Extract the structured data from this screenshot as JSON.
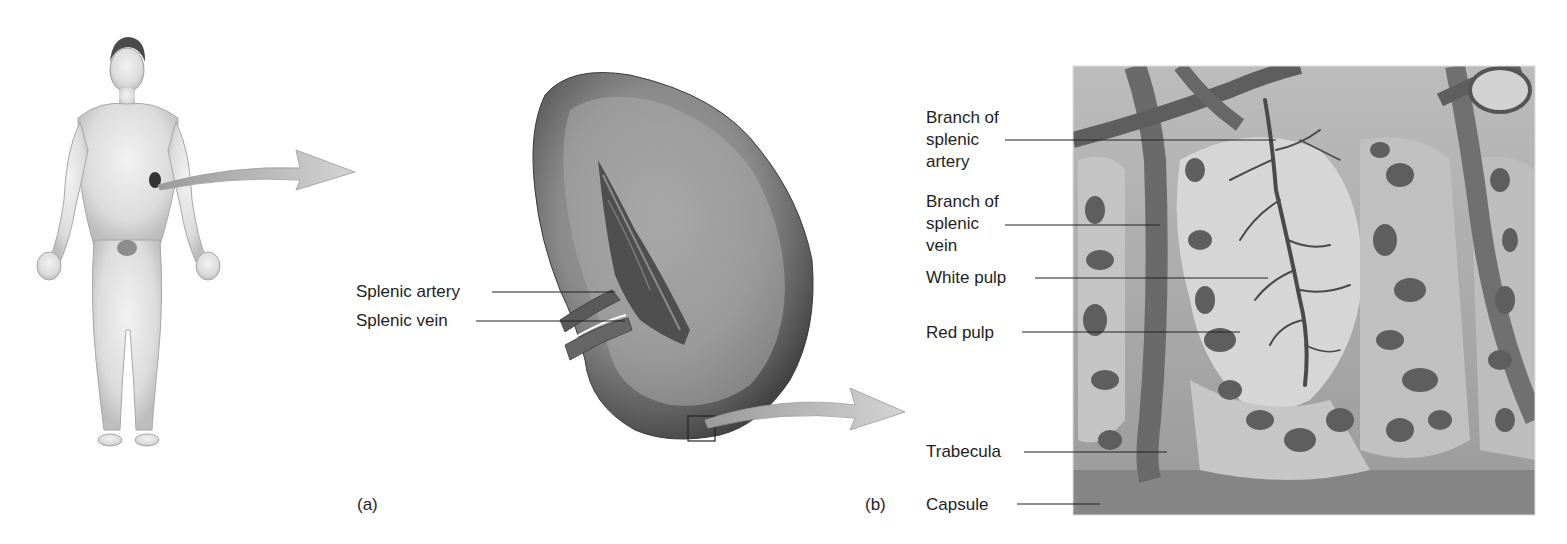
{
  "figure": {
    "panels": [
      {
        "id": "a",
        "label": "(a)"
      },
      {
        "id": "b",
        "label": "(b)"
      }
    ]
  },
  "panel_a": {
    "body_figure": "human-body",
    "organ": "spleen",
    "labels": {
      "splenic_artery": "Splenic artery",
      "splenic_vein": "Splenic vein"
    },
    "tag": "(a)"
  },
  "panel_b": {
    "labels": {
      "branch_artery": "Branch of\nsplenic\nartery",
      "branch_vein": "Branch of\nsplenic\nvein",
      "white_pulp": "White pulp",
      "red_pulp": "Red pulp",
      "trabecula": "Trabecula",
      "capsule": "Capsule"
    },
    "tag": "(b)"
  },
  "colors": {
    "background": "#ffffff",
    "text": "#1e1e1e",
    "leader_line": "#222222",
    "arrow_fill": "#c8c8c8",
    "spleen_dark": "#4a4a4a",
    "spleen_mid": "#7a7a7a",
    "spleen_light": "#a8a8a8",
    "tissue_bg": "#8f8f8f",
    "pulp_light": "#cfcfcf",
    "red_pulp_holes": "#5e5e5e",
    "capsule": "#858585"
  }
}
